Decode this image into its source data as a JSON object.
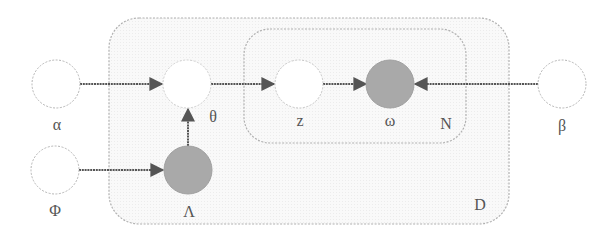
{
  "diagram": {
    "type": "plate-notation-graphical-model",
    "colors": {
      "observed_fill": "#a9a9a9",
      "latent_fill": "#ffffff",
      "node_border": "#b5b5b5",
      "edge": "#555555",
      "plate_border": "#b0b0b0",
      "plate_fill": "#f7f7f7",
      "label": "#555555"
    },
    "plates": [
      {
        "id": "D",
        "label": "D"
      },
      {
        "id": "N",
        "label": "N"
      }
    ],
    "nodes": [
      {
        "id": "alpha",
        "label": "α",
        "observed": false
      },
      {
        "id": "phi",
        "label": "Φ",
        "observed": false
      },
      {
        "id": "theta",
        "label": "θ",
        "observed": false
      },
      {
        "id": "lambda",
        "label": "Λ",
        "observed": true
      },
      {
        "id": "z",
        "label": "z",
        "observed": false
      },
      {
        "id": "omega",
        "label": "ω",
        "observed": true
      },
      {
        "id": "beta",
        "label": "β",
        "observed": false
      }
    ],
    "edges": [
      {
        "from": "α",
        "to": "θ"
      },
      {
        "from": "Φ",
        "to": "Λ"
      },
      {
        "from": "Λ",
        "to": "θ"
      },
      {
        "from": "θ",
        "to": "z"
      },
      {
        "from": "z",
        "to": "ω"
      },
      {
        "from": "β",
        "to": "ω"
      }
    ]
  }
}
